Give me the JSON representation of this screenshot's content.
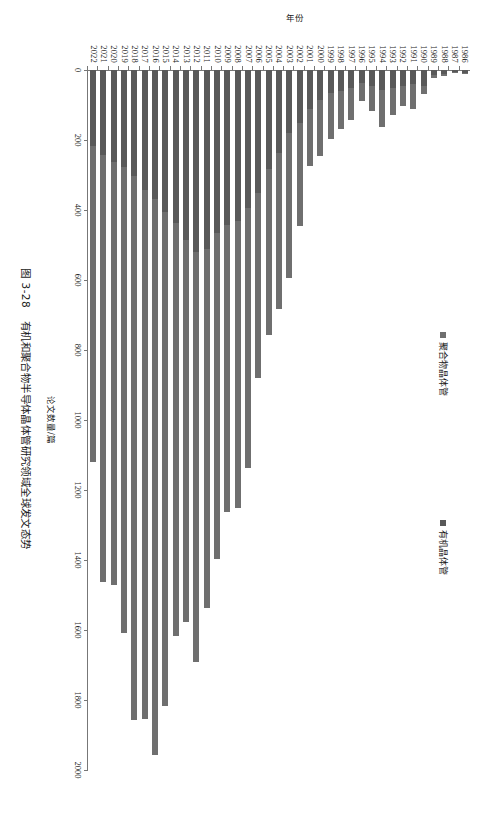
{
  "caption": {
    "number": "图 3-28",
    "text": "有机和聚合物半导体晶体管研究领域全球发文态势"
  },
  "axes": {
    "category_label": "年份",
    "value_label": "论文数量/篇"
  },
  "legend": {
    "organic": "有机晶体管",
    "polymer": "聚合物晶体管"
  },
  "colors": {
    "organic": "#595959",
    "polymer": "#6f6f6f",
    "axis": "#777777"
  },
  "chart_data": {
    "type": "bar",
    "orientation": "horizontal-stacked",
    "title": "有机和聚合物半导体晶体管研究领域全球发文态势",
    "xlabel": "论文数量/篇",
    "ylabel": "年份",
    "xlim": [
      0,
      2000
    ],
    "xticks": [
      0,
      200,
      400,
      600,
      800,
      1000,
      1200,
      1400,
      1600,
      1800,
      2000
    ],
    "grid": false,
    "legend_position": "top-left",
    "categories": [
      "1986",
      "1987",
      "1988",
      "1989",
      "1990",
      "1991",
      "1992",
      "1993",
      "1994",
      "1995",
      "1996",
      "1997",
      "1998",
      "1999",
      "2000",
      "2001",
      "2002",
      "2003",
      "2004",
      "2005",
      "2006",
      "2007",
      "2008",
      "2009",
      "2010",
      "2011",
      "2012",
      "2013",
      "2014",
      "2015",
      "2016",
      "2017",
      "2018",
      "2019",
      "2020",
      "2021",
      "2022"
    ],
    "series": [
      {
        "name": "有机晶体管",
        "values": [
          8,
          6,
          10,
          14,
          46,
          40,
          46,
          52,
          58,
          46,
          38,
          50,
          60,
          66,
          86,
          112,
          150,
          180,
          238,
          284,
          352,
          394,
          430,
          444,
          466,
          512,
          520,
          486,
          438,
          406,
          368,
          344,
          304,
          278,
          262,
          244,
          218
        ]
      },
      {
        "name": "聚合物晶体管",
        "values": [
          4,
          4,
          6,
          10,
          24,
          72,
          56,
          76,
          106,
          72,
          52,
          92,
          108,
          130,
          160,
          162,
          296,
          414,
          446,
          474,
          528,
          744,
          820,
          818,
          930,
          1024,
          1170,
          1090,
          1180,
          1412,
          1590,
          1510,
          1552,
          1332,
          1210,
          1220,
          902
        ]
      }
    ],
    "totals": [
      12,
      10,
      16,
      24,
      70,
      112,
      102,
      128,
      164,
      118,
      90,
      142,
      168,
      196,
      246,
      274,
      446,
      594,
      684,
      758,
      880,
      1138,
      1250,
      1262,
      1396,
      1536,
      1690,
      1576,
      1618,
      1818,
      1958,
      1854,
      1856,
      1610,
      1472,
      1464,
      1120
    ]
  }
}
